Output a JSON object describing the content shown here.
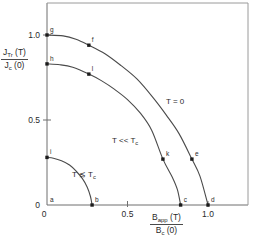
{
  "chart_data": {
    "type": "line",
    "title": "",
    "xlabel": "B_app(T) / B_c(0)",
    "ylabel": "J_Tr(T) / J_c(0)",
    "xlim": [
      0,
      1.15
    ],
    "ylim": [
      0,
      1.12
    ],
    "grid": false,
    "legend_position": "inline-annotations",
    "xticks": [
      {
        "value": 0,
        "label": "0"
      },
      {
        "value": 0.5,
        "label": "0.5"
      },
      {
        "value": 1.0,
        "label": "1.0"
      }
    ],
    "yticks": [
      {
        "value": 0,
        "label": "0"
      },
      {
        "value": 0.5,
        "label": "0.5"
      },
      {
        "value": 1.0,
        "label": "1.0"
      }
    ],
    "series": [
      {
        "name": "T = 0",
        "annotation": "T = 0",
        "x": [
          0.0,
          0.1,
          0.18,
          0.26,
          0.36,
          0.46,
          0.56,
          0.66,
          0.74,
          0.82,
          0.9,
          0.95,
          1.0
        ],
        "y": [
          1.0,
          0.995,
          0.975,
          0.94,
          0.89,
          0.82,
          0.74,
          0.63,
          0.53,
          0.42,
          0.27,
          0.17,
          0.0
        ],
        "markers": [
          {
            "label": "g",
            "x": 0.0,
            "y": 1.0
          },
          {
            "label": "f",
            "x": 0.26,
            "y": 0.94
          },
          {
            "label": "e",
            "x": 0.9,
            "y": 0.27
          },
          {
            "label": "d",
            "x": 1.0,
            "y": 0.0
          }
        ]
      },
      {
        "name": "T << Tc",
        "annotation": "T << T_c",
        "x": [
          0.0,
          0.08,
          0.16,
          0.26,
          0.34,
          0.42,
          0.5,
          0.58,
          0.65,
          0.72,
          0.78,
          0.81,
          0.83
        ],
        "y": [
          0.83,
          0.825,
          0.81,
          0.77,
          0.73,
          0.68,
          0.62,
          0.54,
          0.44,
          0.27,
          0.16,
          0.09,
          0.0
        ],
        "markers": [
          {
            "label": "h",
            "x": 0.0,
            "y": 0.83
          },
          {
            "label": "l",
            "x": 0.26,
            "y": 0.77
          },
          {
            "label": "k",
            "x": 0.72,
            "y": 0.27
          },
          {
            "label": "c",
            "x": 0.83,
            "y": 0.0
          }
        ]
      },
      {
        "name": "T <~ Tc",
        "annotation": "T ≲ T_c",
        "x": [
          0.0,
          0.04,
          0.09,
          0.14,
          0.18,
          0.22,
          0.25,
          0.27,
          0.28
        ],
        "y": [
          0.28,
          0.275,
          0.26,
          0.235,
          0.2,
          0.155,
          0.105,
          0.05,
          0.0
        ],
        "markers": [
          {
            "label": "i",
            "x": 0.0,
            "y": 0.28
          },
          {
            "label": "b",
            "x": 0.28,
            "y": 0.0
          }
        ]
      }
    ],
    "origin_marker": {
      "label": "a",
      "x": 0.0,
      "y": 0.0
    }
  },
  "axis_titles": {
    "y": {
      "numerator_main": "J",
      "numerator_sub": "Tr",
      "numerator_tail": " (T)",
      "denominator_main": "J",
      "denominator_sub": "c",
      "denominator_tail": " (0)"
    },
    "x": {
      "numerator_main": "B",
      "numerator_sub": "app",
      "numerator_tail": " (T)",
      "denominator_main": "B",
      "denominator_sub": "c",
      "denominator_tail": " (0)"
    }
  },
  "annotations": {
    "curve_top": {
      "main": "T = 0",
      "sub": ""
    },
    "curve_mid": {
      "main": "T << T",
      "sub": "c"
    },
    "curve_low": {
      "main": "T ≲ T",
      "sub": "c"
    }
  },
  "colors": {
    "background": "#ffffff",
    "axis": "#6f6f6f",
    "frame": "#9a9a9a",
    "curve": "#4a4a4a",
    "marker": "#1c1c1c",
    "text": "#2a2a2a"
  }
}
